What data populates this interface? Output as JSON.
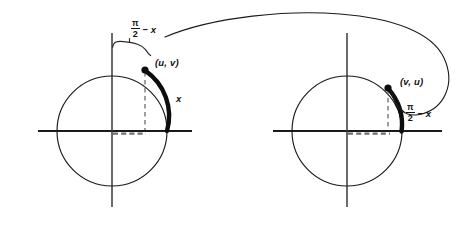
{
  "figure": {
    "background_color": "#ffffff",
    "ink_color": "#111111",
    "stroke_color": "#1a1a1a",
    "width": 472,
    "height": 233
  },
  "left_diagram": {
    "name": "left-unit-circle",
    "center_x": 112,
    "center_y": 131,
    "radius": 55,
    "point_label": "(u, v)",
    "point_x": 145,
    "point_y": 70,
    "arc_label": "x",
    "arc_label_x": 176,
    "arc_label_y": 99,
    "brace_label_numerator": "π",
    "brace_label_denominator": "2",
    "brace_label_suffix": "− x",
    "brace_label_x": 131,
    "brace_label_y": 27,
    "highlighted_arc_start_angle_deg": 90,
    "highlighted_arc_end_angle_deg": 0,
    "highlighted_arc_description": "thick arc of length x from point (u, v) clockwise to the positive u-axis"
  },
  "right_diagram": {
    "name": "right-unit-circle",
    "center_x": 347,
    "center_y": 131,
    "radius": 55,
    "point_label": "(v, u)",
    "point_x": 388,
    "point_y": 88,
    "arc_label_numerator": "π",
    "arc_label_denominator": "2",
    "arc_label_suffix": "− x",
    "arc_label_x": 406,
    "arc_label_y": 111,
    "highlighted_arc_description": "thick arc of length pi/2 minus x from point (v, u) down to the positive u-axis"
  },
  "connector": {
    "name": "mapping-arrow",
    "description": "curved arrow sweeping from the left circle arc label over the top and hooking down to the point (v, u) on the right circle",
    "start_x": 165,
    "start_y": 37,
    "end_x": 392,
    "end_y": 92
  }
}
